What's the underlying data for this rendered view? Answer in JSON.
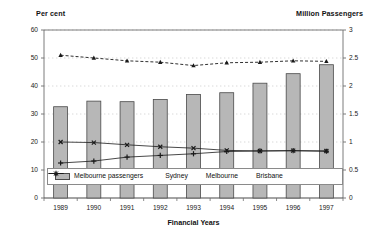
{
  "chart_data": {
    "type": "bar",
    "title": "",
    "xlabel": "Financial Years",
    "ylabel": "Per cent",
    "y2label": "Million Passengers",
    "categories": [
      "1989",
      "1990",
      "1991",
      "1992",
      "1993",
      "1994",
      "1995",
      "1996",
      "1997"
    ],
    "ylim": [
      0,
      60
    ],
    "yticks": [
      "0",
      "10",
      "20",
      "30",
      "40",
      "50",
      "60"
    ],
    "y2lim": [
      0,
      3
    ],
    "y2ticks": [
      "0",
      "0.5",
      "1",
      "1.5",
      "2",
      "2.5",
      "3"
    ],
    "grid": true,
    "legend_position": "bottom",
    "series": [
      {
        "name": "Melbourne passengers",
        "type": "bar",
        "axis": "right",
        "unit": "million passengers",
        "values": [
          1.63,
          1.73,
          1.72,
          1.76,
          1.85,
          1.88,
          2.05,
          2.22,
          2.38
        ]
      },
      {
        "name": "Sydney",
        "type": "line",
        "axis": "left",
        "unit": "per cent",
        "marker": "triangle",
        "dashed": true,
        "values": [
          51.0,
          50.0,
          49.0,
          48.5,
          47.3,
          48.3,
          48.5,
          49.0,
          48.8
        ]
      },
      {
        "name": "Melbourne",
        "type": "line",
        "axis": "left",
        "unit": "per cent",
        "marker": "x",
        "dashed": false,
        "values": [
          20.0,
          19.8,
          19.0,
          18.3,
          17.8,
          17.0,
          16.8,
          16.9,
          16.8
        ]
      },
      {
        "name": "Brisbane",
        "type": "line",
        "axis": "left",
        "unit": "per cent",
        "marker": "plus",
        "dashed": false,
        "values": [
          12.5,
          13.2,
          14.6,
          15.2,
          15.8,
          16.6,
          16.8,
          16.9,
          16.7
        ]
      }
    ]
  },
  "labels": {
    "left_axis_title": "Per cent",
    "right_axis_title": "Million Passengers",
    "x_axis_title": "Financial Years"
  },
  "legend": {
    "entries": [
      {
        "label": "Melbourne passengers",
        "marker": "bar-swatch"
      },
      {
        "label": "Sydney",
        "marker": "triangle-marker"
      },
      {
        "label": "Melbourne",
        "marker": "line-x-marker"
      },
      {
        "label": "Brisbane",
        "marker": "line-plus-marker"
      }
    ]
  },
  "colors": {
    "bar_fill": "#b7b7b7",
    "bar_stroke": "#4a4a4a",
    "line": "#1a1a1a",
    "grid": "#c9c9c9",
    "axis": "#6e6e6e",
    "text": "#111111"
  }
}
